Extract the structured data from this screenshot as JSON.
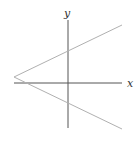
{
  "diagram": {
    "type": "coordinate-graph",
    "axes": {
      "x_label": "x",
      "y_label": "y",
      "ticks": false,
      "color": "#444444"
    },
    "lines": [
      {
        "name": "upper-ray",
        "from": [
          14,
          77
        ],
        "to": [
          122,
          25
        ],
        "color": "#aaaaaa"
      },
      {
        "name": "lower-ray",
        "from": [
          14,
          77
        ],
        "to": [
          122,
          129
        ],
        "color": "#aaaaaa"
      }
    ],
    "vertex": {
      "position": "left of origin on negative x-axis side",
      "pixel": [
        14,
        77
      ]
    }
  }
}
